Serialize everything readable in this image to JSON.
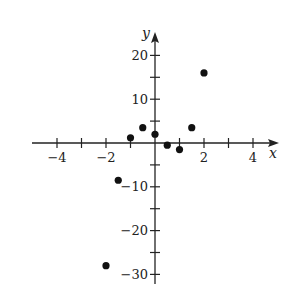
{
  "chart_data": {
    "type": "scatter",
    "title": "",
    "xlabel": "x",
    "ylabel": "y",
    "xlim": [
      -5,
      5
    ],
    "ylim": [
      -30,
      25
    ],
    "x_ticks": [
      -4,
      -3,
      -2,
      -1,
      1,
      2,
      3,
      4
    ],
    "x_tick_labels": [
      "-4",
      "-2",
      "2",
      "4"
    ],
    "x_labeled_ticks": [
      -4,
      -2,
      2,
      4
    ],
    "y_ticks": [
      -30,
      -25,
      -20,
      -15,
      -10,
      -5,
      5,
      10,
      15,
      20
    ],
    "y_tick_labels": [
      "20",
      "10",
      "-10",
      "-20",
      "-30"
    ],
    "y_labeled_ticks": [
      20,
      10,
      -10,
      -20,
      -30
    ],
    "grid": false,
    "legend": null,
    "points": [
      {
        "x": -2,
        "y": -28
      },
      {
        "x": -1.5,
        "y": -8.5
      },
      {
        "x": -1,
        "y": 1.2
      },
      {
        "x": -0.5,
        "y": 3.5
      },
      {
        "x": 0,
        "y": 2
      },
      {
        "x": 0.5,
        "y": -0.5
      },
      {
        "x": 1,
        "y": -1.5
      },
      {
        "x": 1.5,
        "y": 3.5
      },
      {
        "x": 2,
        "y": 16
      }
    ],
    "colors": {
      "axis": "#222222",
      "point": "#111111"
    }
  }
}
